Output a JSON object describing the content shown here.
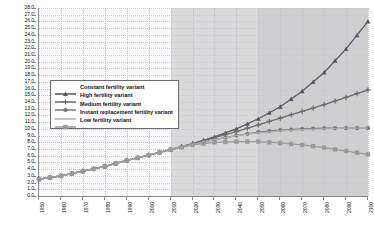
{
  "chart_data": {
    "type": "line",
    "title": "",
    "xlabel": "",
    "ylabel": "",
    "xlim": [
      1950,
      2100
    ],
    "ylim": [
      0.0,
      28.0
    ],
    "y_tick_step": 1.0,
    "x_tick_step": 10,
    "grid": true,
    "legend_position": "inner-left",
    "x": [
      1950,
      1960,
      1970,
      1980,
      1990,
      2000,
      2010,
      2020,
      2030,
      2040,
      2050,
      2060,
      2070,
      2080,
      2090,
      2100
    ],
    "xtick_labels": [
      "1950",
      "1960",
      "1970",
      "1980",
      "1990",
      "2000",
      "2010",
      "2020",
      "2030",
      "2040",
      "2050",
      "2060",
      "2070",
      "2080",
      "2090",
      "2100"
    ],
    "ytick_labels": [
      "0.0",
      "1.0",
      "2.0",
      "3.0",
      "4.0",
      "5.0",
      "6.0",
      "7.0",
      "8.0",
      "9.0",
      "10.0",
      "11.0",
      "12.0",
      "13.0",
      "14.0",
      "15.0",
      "16.0",
      "17.0",
      "18.0",
      "19.0",
      "20.0",
      "21.0",
      "22.0",
      "23.0",
      "24.0",
      "25.0",
      "26.0",
      "27.0",
      "28.0"
    ],
    "shaded_regions": [
      {
        "from": 2010,
        "to": 2050,
        "color": "#d9d9d9"
      },
      {
        "from": 2050,
        "to": 2100,
        "color": "#cfcfcf"
      }
    ],
    "series": [
      {
        "name": "Constant fertility variant",
        "marker": "triangle",
        "color": "#555566",
        "values": [
          2.5,
          3.0,
          3.7,
          4.4,
          5.3,
          6.1,
          6.9,
          7.8,
          8.8,
          10.0,
          11.5,
          13.3,
          15.6,
          18.4,
          21.9,
          26.0
        ]
      },
      {
        "name": "High fertility variant",
        "marker": "plus",
        "color": "#6a6a6a",
        "values": [
          2.5,
          3.0,
          3.7,
          4.4,
          5.3,
          6.1,
          6.9,
          7.8,
          8.7,
          9.6,
          10.6,
          11.6,
          12.6,
          13.6,
          14.7,
          15.8
        ]
      },
      {
        "name": "Medium fertility variant",
        "marker": "circle",
        "color": "#777777",
        "values": [
          2.5,
          3.0,
          3.7,
          4.4,
          5.3,
          6.1,
          6.9,
          7.7,
          8.4,
          9.0,
          9.5,
          9.8,
          10.0,
          10.1,
          10.1,
          10.1
        ]
      },
      {
        "name": "Instant replacement fertility variant",
        "marker": "none",
        "color": "#b0b0b0",
        "values": [
          2.5,
          3.0,
          3.7,
          4.4,
          5.3,
          6.1,
          6.9,
          7.7,
          8.4,
          9.0,
          9.4,
          9.7,
          9.9,
          10.0,
          10.1,
          10.1
        ]
      },
      {
        "name": "Low fertility variant",
        "marker": "square",
        "color": "#9a9a9a",
        "values": [
          2.5,
          3.0,
          3.7,
          4.4,
          5.3,
          6.1,
          6.9,
          7.6,
          8.0,
          8.1,
          8.1,
          7.9,
          7.6,
          7.2,
          6.7,
          6.2
        ]
      }
    ]
  }
}
